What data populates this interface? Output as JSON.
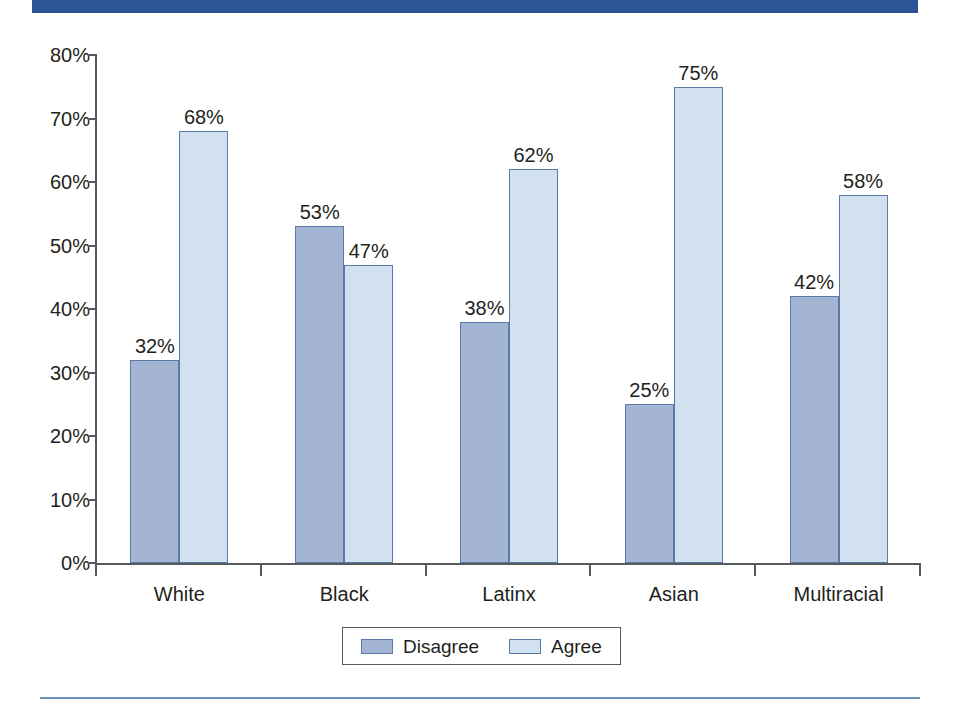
{
  "chart_data": {
    "type": "bar",
    "title": "",
    "subtitle": "",
    "xlabel": "",
    "ylabel": "",
    "ylim": [
      0,
      80
    ],
    "yticks": [
      "0%",
      "10%",
      "20%",
      "30%",
      "40%",
      "50%",
      "60%",
      "70%",
      "80%"
    ],
    "ytick_values": [
      0,
      10,
      20,
      30,
      40,
      50,
      60,
      70,
      80
    ],
    "grid": false,
    "legend_position": "bottom-center",
    "categories": [
      "White",
      "Black",
      "Latinx",
      "Asian",
      "Multiracial"
    ],
    "series": [
      {
        "name": "Disagree",
        "color": "#a3b5d2",
        "values": [
          32,
          53,
          38,
          25,
          42
        ],
        "labels": [
          "32%",
          "53%",
          "38%",
          "25%",
          "42%"
        ]
      },
      {
        "name": "Agree",
        "color": "#d2e1f0",
        "values": [
          68,
          47,
          62,
          75,
          58
        ],
        "labels": [
          "68%",
          "47%",
          "62%",
          "75%",
          "58%"
        ]
      }
    ]
  },
  "legend": {
    "items": [
      {
        "label": "Disagree",
        "color": "#a3b5d2"
      },
      {
        "label": "Agree",
        "color": "#d2e1f0"
      }
    ]
  },
  "colors": {
    "banner": "#2d5596",
    "bar_border": "#5a7aa8",
    "axis": "#58595b",
    "rule": "#6f8fc0",
    "text": "#231f20"
  }
}
